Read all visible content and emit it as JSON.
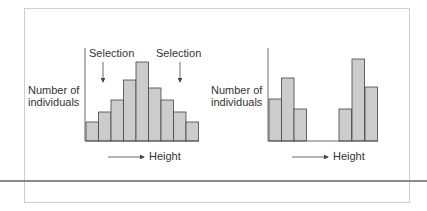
{
  "colors": {
    "bar_fill": "#cccccc",
    "bar_stroke": "#444444",
    "axis": "#444444",
    "text": "#333333"
  },
  "chart_data": [
    {
      "type": "bar",
      "title": "",
      "ylabel": "Number of individuals",
      "xlabel": "Height",
      "annotations": [
        "Selection",
        "Selection"
      ],
      "categories": [
        "1",
        "2",
        "3",
        "4",
        "5",
        "6",
        "7",
        "8",
        "9"
      ],
      "values": [
        19,
        29,
        41,
        61,
        79,
        53,
        41,
        29,
        19
      ],
      "bars_px": [
        {
          "x": 86,
          "top": 122
        },
        {
          "x": 98.5,
          "top": 112
        },
        {
          "x": 111,
          "top": 100
        },
        {
          "x": 123.5,
          "top": 80
        },
        {
          "x": 136,
          "top": 62
        },
        {
          "x": 148.5,
          "top": 88
        },
        {
          "x": 161,
          "top": 100
        },
        {
          "x": 173.5,
          "top": 112
        },
        {
          "x": 186,
          "top": 122
        }
      ]
    },
    {
      "type": "bar",
      "title": "",
      "ylabel": "Number of individuals",
      "xlabel": "Height",
      "categories": [
        "1",
        "2",
        "3",
        "4",
        "5",
        "6",
        "7",
        "8",
        "9"
      ],
      "values": [
        41,
        62,
        31,
        0,
        0,
        31,
        81,
        53,
        0
      ],
      "bars_px": [
        {
          "x": 269,
          "top": 99
        },
        {
          "x": 281.5,
          "top": 78
        },
        {
          "x": 294,
          "top": 109
        },
        {
          "x": 339,
          "top": 109
        },
        {
          "x": 352,
          "top": 59
        },
        {
          "x": 365,
          "top": 87
        }
      ]
    }
  ],
  "labels": {
    "left_ylabel_1": "Number of",
    "left_ylabel_2": "individuals",
    "right_ylabel_1": "Number of",
    "right_ylabel_2": "individuals",
    "selection_left": "Selection",
    "selection_right": "Selection",
    "xlabel_left": "Height",
    "xlabel_right": "Height"
  }
}
